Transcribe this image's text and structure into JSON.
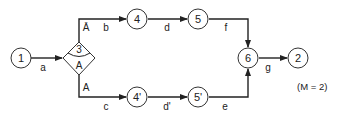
{
  "diagram": {
    "nodes": [
      {
        "id": "n1",
        "label": "1",
        "x": 21,
        "y": 58
      },
      {
        "id": "n4",
        "label": "4",
        "x": 137,
        "y": 19
      },
      {
        "id": "n5",
        "label": "5",
        "x": 198,
        "y": 19
      },
      {
        "id": "n4p",
        "label": "4'",
        "x": 137,
        "y": 97
      },
      {
        "id": "n5p",
        "label": "5'",
        "x": 198,
        "y": 97
      },
      {
        "id": "n6",
        "label": "6",
        "x": 248,
        "y": 58
      },
      {
        "id": "n2",
        "label": "2",
        "x": 298,
        "y": 58
      }
    ],
    "decision": {
      "id": "n3",
      "label_top": "3",
      "label_bottom": "A",
      "x": 79,
      "y": 58
    },
    "edges": [
      {
        "id": "a",
        "label": "a"
      },
      {
        "id": "b",
        "label": "b",
        "branch": "Ā"
      },
      {
        "id": "c",
        "label": "c",
        "branch": "A"
      },
      {
        "id": "d",
        "label": "d"
      },
      {
        "id": "dp",
        "label": "d'"
      },
      {
        "id": "f",
        "label": "f"
      },
      {
        "id": "e",
        "label": "e"
      },
      {
        "id": "g",
        "label": "g"
      }
    ],
    "branch_labels": {
      "top": "Ā",
      "bottom": "A"
    },
    "note": "(M = 2)"
  }
}
